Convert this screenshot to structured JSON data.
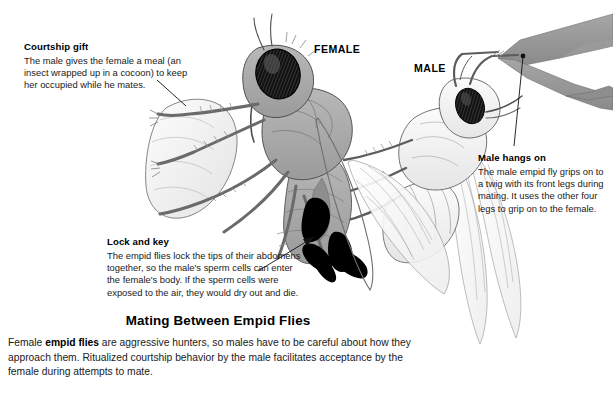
{
  "figure": {
    "title": "Mating Between Empid Flies",
    "caption_pre": "Female ",
    "caption_bold": "empid flies",
    "caption_post": " are aggressive hunters, so males have to be careful about how they approach them. Ritualized courtship behavior by the male facilitates acceptance by the female during attempts to mate."
  },
  "labels": {
    "female": "FEMALE",
    "male": "MALE"
  },
  "callouts": {
    "gift": {
      "heading": "Courtship gift",
      "line1": "The male gives the female a meal (an",
      "line2": "insect wrapped up in a cocoon) to keep",
      "line3": "her occupied while he mates."
    },
    "lock": {
      "heading": "Lock and key",
      "line1": "The empid flies lock the tips of their abdomens",
      "line2": "together, so the male's sperm cells can enter",
      "line3": "the female's body. If the sperm cells were",
      "line4": "exposed to the air, they would dry out and die."
    },
    "hangs": {
      "heading": "Male hangs on",
      "line1": "The male empid fly grips on to",
      "line2": "a twig with its front legs during",
      "line3": "mating. It uses the other four",
      "line4": "legs to grip on to the female."
    }
  },
  "illustration": {
    "subject": "two mating empid flies on a twig",
    "female_body_fill": "#a9a9a9",
    "male_body_fill": "#f4f4f4",
    "eye_fill": "#1a1a1a",
    "twig_fill": "#9a9a9a",
    "cocoon_fill": "#f0f0f0",
    "wing_stroke": "#7a7a7a",
    "genitalia_fill": "#000000",
    "outline": "#4a4a4a",
    "background": "#ffffff"
  }
}
